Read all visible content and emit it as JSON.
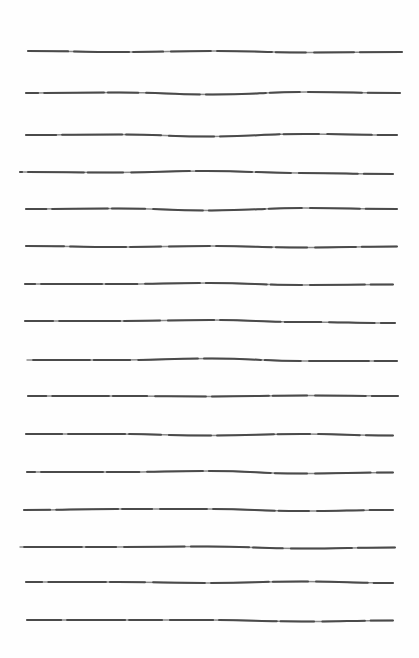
{
  "page": {
    "background": "#fefefe",
    "stroke_color": "#4a4a4a",
    "stroke_light": "#8a8a8a"
  },
  "lines": [
    {
      "y": 51,
      "x1": 28,
      "x2": 402,
      "wave": [
        0,
        1,
        0,
        1.5,
        1
      ]
    },
    {
      "y": 93,
      "x1": 26,
      "x2": 400,
      "wave": [
        0,
        -0.5,
        1.5,
        -1,
        0
      ]
    },
    {
      "y": 135,
      "x1": 26,
      "x2": 397,
      "wave": [
        0,
        -0.5,
        1.5,
        -1,
        0
      ]
    },
    {
      "y": 172,
      "x1": 20,
      "x2": 393,
      "wave": [
        0,
        0.5,
        -1,
        1,
        2
      ]
    },
    {
      "y": 209,
      "x1": 26,
      "x2": 397,
      "wave": [
        0,
        -0.5,
        1.5,
        -1,
        0
      ]
    },
    {
      "y": 246,
      "x1": 26,
      "x2": 397,
      "wave": [
        0,
        1,
        0,
        1.5,
        0.5
      ]
    },
    {
      "y": 284,
      "x1": 25,
      "x2": 393,
      "wave": [
        0,
        0,
        -1,
        1,
        0.5
      ]
    },
    {
      "y": 321,
      "x1": 25,
      "x2": 395,
      "wave": [
        0,
        0,
        -1,
        1,
        2
      ]
    },
    {
      "y": 360,
      "x1": 27,
      "x2": 397,
      "wave": [
        0,
        0,
        -1.5,
        1,
        1
      ]
    },
    {
      "y": 396,
      "x1": 28,
      "x2": 398,
      "wave": [
        0,
        0,
        0.5,
        -0.5,
        0
      ]
    },
    {
      "y": 434,
      "x1": 26,
      "x2": 393,
      "wave": [
        0,
        0,
        1.5,
        0,
        1.5
      ]
    },
    {
      "y": 472,
      "x1": 27,
      "x2": 393,
      "wave": [
        0,
        0,
        -1,
        1.5,
        0.5
      ]
    },
    {
      "y": 510,
      "x1": 24,
      "x2": 393,
      "wave": [
        0,
        -1,
        -1,
        1,
        0
      ]
    },
    {
      "y": 547,
      "x1": 20,
      "x2": 395,
      "wave": [
        0,
        0,
        -0.5,
        1.5,
        0.5
      ]
    },
    {
      "y": 582,
      "x1": 26,
      "x2": 393,
      "wave": [
        0,
        0,
        1,
        -0.5,
        1
      ]
    },
    {
      "y": 620,
      "x1": 27,
      "x2": 393,
      "wave": [
        0,
        0,
        0,
        1.5,
        0.5
      ]
    }
  ]
}
